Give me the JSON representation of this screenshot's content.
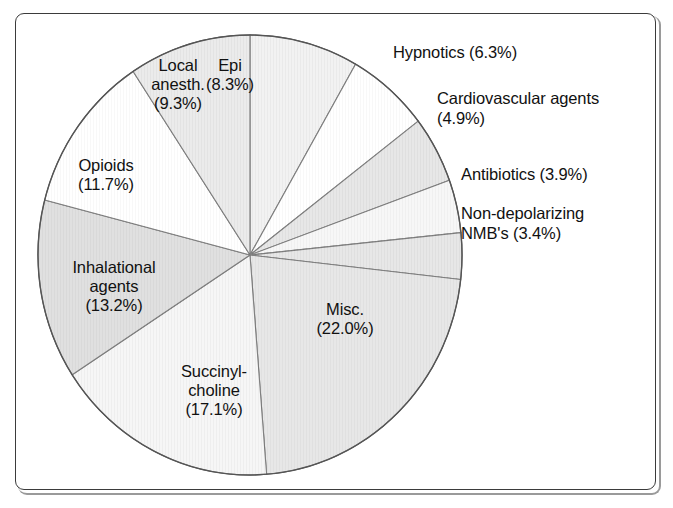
{
  "figure": {
    "frame_border_color": "#3b3b3b",
    "background_color": "#ffffff",
    "text_color": "#111111"
  },
  "chart_data": {
    "type": "pie",
    "title": "",
    "subtitle": "",
    "xlabel": "",
    "ylabel": "",
    "legend_position": "none",
    "grid": false,
    "units": "percent",
    "start_angle_deg": 0,
    "direction": "clockwise",
    "total": 100.1,
    "categories": [
      "Epi",
      "Hypnotics",
      "Cardiovascular agents",
      "Antibiotics",
      "Non-depolarizing NMB's",
      "Misc.",
      "Succinyl-choline",
      "Inhalational agents",
      "Opioids",
      "Local anesth."
    ],
    "values": [
      8.3,
      6.3,
      4.9,
      3.9,
      3.4,
      22.0,
      17.1,
      13.2,
      11.7,
      9.3
    ],
    "slices": [
      {
        "name": "Epi",
        "label_line1": "Epi",
        "label_line2": "(8.3%)",
        "value": 8.3,
        "percent_text": "(8.3%)",
        "fill": "#ececec",
        "label_placement": "inside"
      },
      {
        "name": "Hypnotics",
        "label_line1": "Hypnotics (6.3%)",
        "label_line2": "",
        "value": 6.3,
        "percent_text": "(6.3%)",
        "fill": "#ffffff",
        "label_placement": "outside"
      },
      {
        "name": "Cardiovascular agents",
        "label_line1": "Cardiovascular agents",
        "label_line2": "(4.9%)",
        "value": 4.9,
        "percent_text": "(4.9%)",
        "fill": "#dcdcdc",
        "label_placement": "outside"
      },
      {
        "name": "Antibiotics",
        "label_line1": "Antibiotics (3.9%)",
        "label_line2": "",
        "value": 3.9,
        "percent_text": "(3.9%)",
        "fill": "#f4f4f4",
        "label_placement": "outside"
      },
      {
        "name": "Non-depolarizing NMB's",
        "label_line1": "Non-depolarizing",
        "label_line2": "NMB's (3.4%)",
        "value": 3.4,
        "percent_text": "(3.4%)",
        "fill": "#dcdcdc",
        "label_placement": "outside"
      },
      {
        "name": "Misc.",
        "label_line1": "Misc.",
        "label_line2": "(22.0%)",
        "value": 22.0,
        "percent_text": "(22.0%)",
        "fill": "#dddddd",
        "label_placement": "inside"
      },
      {
        "name": "Succinyl-choline",
        "label_line1": "Succinyl-",
        "label_line2": "choline",
        "label_line3": "(17.1%)",
        "value": 17.1,
        "percent_text": "(17.1%)",
        "fill": "#f2f2f2",
        "label_placement": "inside"
      },
      {
        "name": "Inhalational agents",
        "label_line1": "Inhalational",
        "label_line2": "agents",
        "label_line3": "(13.2%)",
        "value": 13.2,
        "percent_text": "(13.2%)",
        "fill": "#d3d3d3",
        "label_placement": "inside"
      },
      {
        "name": "Opioids",
        "label_line1": "Opioids",
        "label_line2": "(11.7%)",
        "value": 11.7,
        "percent_text": "(11.7%)",
        "fill": "#ffffff",
        "label_placement": "inside"
      },
      {
        "name": "Local anesth.",
        "label_line1": "Local",
        "label_line2": "anesth.",
        "label_line3": "(9.3%)",
        "value": 9.3,
        "percent_text": "(9.3%)",
        "fill": "#e2e2e2",
        "label_placement": "inside"
      }
    ]
  },
  "labels": {
    "epi": "Epi\n(8.3%)",
    "hypnotics": "Hypnotics (6.3%)",
    "cardiovascular": "Cardiovascular agents\n(4.9%)",
    "antibiotics": "Antibiotics (3.9%)",
    "nmb": "Non-depolarizing\nNMB's (3.4%)",
    "misc": "Misc.\n(22.0%)",
    "succinylcholine": "Succinyl-\ncholine\n(17.1%)",
    "inhalational": "Inhalational\nagents\n(13.2%)",
    "opioids": "Opioids\n(11.7%)",
    "local_anesth": "Local\nanesth.\n(9.3%)"
  }
}
